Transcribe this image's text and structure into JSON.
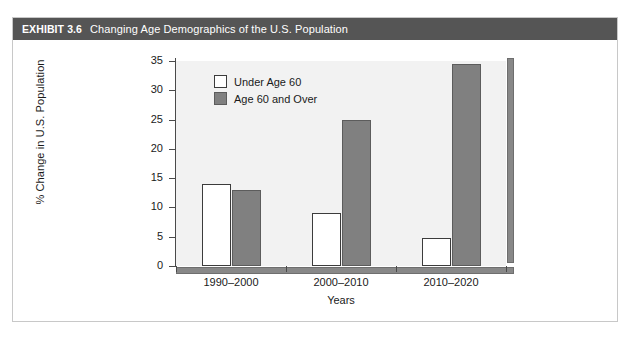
{
  "exhibit": {
    "label": "EXHIBIT 3.6",
    "title": "Changing Age Demographics of the U.S. Population",
    "header_bg": "#555555",
    "header_text_color": "#ffffff",
    "card_bg": "#ffffff",
    "card_border": "#c8c8c8"
  },
  "chart_data": {
    "type": "bar",
    "title": "Changing Age Demographics of the U.S. Population",
    "xlabel": "Years",
    "ylabel": "% Change in U.S. Population",
    "categories": [
      "1990–2000",
      "2000–2010",
      "2010–2020"
    ],
    "series": [
      {
        "name": "Under Age 60",
        "values": [
          14,
          9,
          4.7
        ],
        "color": "#ffffff",
        "border": "#3c3c3c"
      },
      {
        "name": "Age 60 and Over",
        "values": [
          13,
          25,
          34.5
        ],
        "color": "#808080",
        "border": "#5c5c5c"
      }
    ],
    "ylim": [
      0,
      35
    ],
    "yticks": [
      0,
      5,
      10,
      15,
      20,
      25,
      30,
      35
    ],
    "ytick_labels": [
      "0",
      "5",
      "10",
      "15",
      "20",
      "25",
      "30",
      "35"
    ],
    "grid": false,
    "legend_position": "top-left",
    "plot_bg": "#f2f2f2",
    "axis_color": "#4a4a4a"
  }
}
